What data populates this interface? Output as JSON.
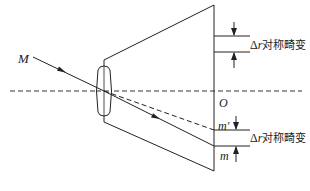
{
  "diagram": {
    "type": "optics-schematic",
    "colors": {
      "line": "#222222",
      "background": "#ffffff"
    },
    "labels": {
      "incident_point": "M",
      "origin": "O",
      "ideal_image_point": "m′",
      "actual_image_point": "m",
      "distortion_top": "Δr对称畸变",
      "distortion_bottom": "Δr对称畸变",
      "delta_symbol": "Δ",
      "r_symbol": "r",
      "distortion_text": "对称畸变"
    },
    "elements": [
      {
        "name": "lens",
        "shape": "rounded-rect"
      },
      {
        "name": "image-plane",
        "shape": "vertical-line"
      },
      {
        "name": "optical-axis",
        "style": "dashed"
      },
      {
        "name": "incident-ray",
        "style": "solid-with-arrow"
      },
      {
        "name": "ideal-ray",
        "style": "dashed"
      }
    ]
  }
}
